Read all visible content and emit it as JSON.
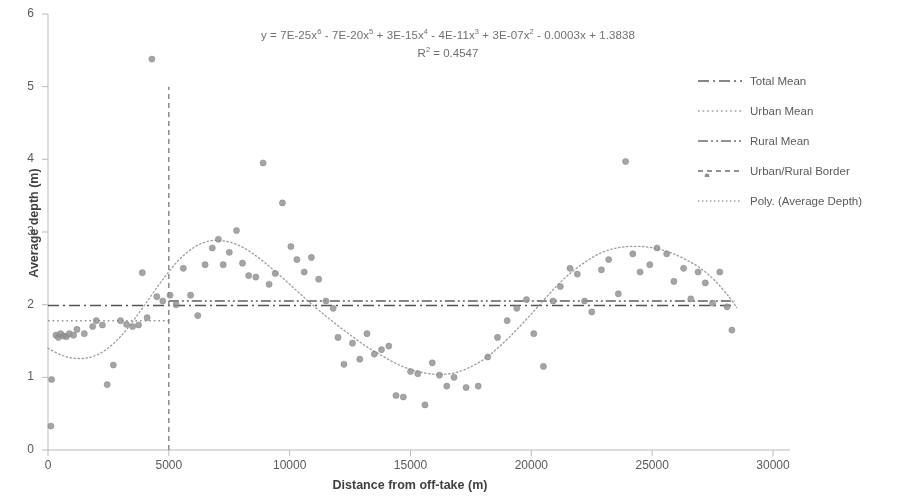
{
  "chart_data": {
    "type": "scatter",
    "title": "",
    "xlabel": "Distance from off-take (m)",
    "ylabel": "Average depth (m)",
    "xlim": [
      0,
      30000
    ],
    "ylim": [
      0,
      6
    ],
    "xticks": [
      "0",
      "5000",
      "10000",
      "15000",
      "20000",
      "25000",
      "30000"
    ],
    "yticks": [
      "0",
      "1",
      "2",
      "3",
      "4",
      "5",
      "6"
    ],
    "grid": false,
    "legend_position": "right",
    "annotations": {
      "equation": "y = 7E-25x⁶ - 7E-20x⁵ + 3E-15x⁴ - 4E-11x³ + 3E-07x² - 0.0003x + 1.3838",
      "equation_parts": {
        "prefix": "y = 7E-25x",
        "e1": "6",
        "t2": " - 7E-20x",
        "e2": "5",
        "t3": " + 3E-15x",
        "e3": "4",
        "t4": " - 4E-11x",
        "e4": "3",
        "t5": " + 3E-07x",
        "e5": "2",
        "t6": " - 0.0003x + 1.3838"
      },
      "r_squared_label": "R",
      "r_squared_sup": "2",
      "r_squared_value": " = 0.4547"
    },
    "series": [
      {
        "name": "Average Depth",
        "type": "scatter",
        "marker_color": "#8a8a8a",
        "points": [
          [
            120,
            0.33
          ],
          [
            150,
            0.97
          ],
          [
            330,
            1.58
          ],
          [
            430,
            1.55
          ],
          [
            520,
            1.6
          ],
          [
            640,
            1.57
          ],
          [
            760,
            1.56
          ],
          [
            880,
            1.6
          ],
          [
            1060,
            1.58
          ],
          [
            1200,
            1.66
          ],
          [
            1500,
            1.6
          ],
          [
            1850,
            1.7
          ],
          [
            2000,
            1.78
          ],
          [
            2250,
            1.72
          ],
          [
            2450,
            0.9
          ],
          [
            2700,
            1.17
          ],
          [
            3000,
            1.78
          ],
          [
            3250,
            1.73
          ],
          [
            3500,
            1.7
          ],
          [
            3750,
            1.72
          ],
          [
            3900,
            2.44
          ],
          [
            4100,
            1.82
          ],
          [
            4300,
            5.38
          ],
          [
            4500,
            2.11
          ],
          [
            4750,
            2.05
          ],
          [
            5050,
            2.13
          ],
          [
            5300,
            2.0
          ],
          [
            5600,
            2.5
          ],
          [
            5900,
            2.13
          ],
          [
            6200,
            1.85
          ],
          [
            6500,
            2.55
          ],
          [
            6800,
            2.78
          ],
          [
            7050,
            2.9
          ],
          [
            7250,
            2.55
          ],
          [
            7500,
            2.72
          ],
          [
            7800,
            3.02
          ],
          [
            8050,
            2.57
          ],
          [
            8300,
            2.4
          ],
          [
            8600,
            2.38
          ],
          [
            8900,
            3.95
          ],
          [
            9150,
            2.28
          ],
          [
            9400,
            2.43
          ],
          [
            9700,
            3.4
          ],
          [
            10050,
            2.8
          ],
          [
            10300,
            2.62
          ],
          [
            10600,
            2.45
          ],
          [
            10900,
            2.65
          ],
          [
            11200,
            2.35
          ],
          [
            11500,
            2.05
          ],
          [
            11800,
            1.95
          ],
          [
            12000,
            1.55
          ],
          [
            12250,
            1.18
          ],
          [
            12600,
            1.47
          ],
          [
            12900,
            1.25
          ],
          [
            13200,
            1.6
          ],
          [
            13500,
            1.32
          ],
          [
            13800,
            1.38
          ],
          [
            14100,
            1.43
          ],
          [
            14400,
            0.75
          ],
          [
            14700,
            0.73
          ],
          [
            15000,
            1.08
          ],
          [
            15300,
            1.05
          ],
          [
            15600,
            0.62
          ],
          [
            15900,
            1.2
          ],
          [
            16200,
            1.03
          ],
          [
            16500,
            0.88
          ],
          [
            16800,
            1.0
          ],
          [
            17300,
            0.86
          ],
          [
            17800,
            0.88
          ],
          [
            18200,
            1.28
          ],
          [
            18600,
            1.55
          ],
          [
            19000,
            1.78
          ],
          [
            19400,
            1.95
          ],
          [
            19800,
            2.07
          ],
          [
            20100,
            1.6
          ],
          [
            20500,
            1.15
          ],
          [
            20900,
            2.05
          ],
          [
            21200,
            2.25
          ],
          [
            21600,
            2.5
          ],
          [
            21900,
            2.42
          ],
          [
            22200,
            2.05
          ],
          [
            22500,
            1.9
          ],
          [
            22900,
            2.48
          ],
          [
            23200,
            2.62
          ],
          [
            23600,
            2.15
          ],
          [
            23900,
            3.97
          ],
          [
            24200,
            2.7
          ],
          [
            24500,
            2.45
          ],
          [
            24900,
            2.55
          ],
          [
            25200,
            2.78
          ],
          [
            25600,
            2.7
          ],
          [
            25900,
            2.32
          ],
          [
            26300,
            2.5
          ],
          [
            26600,
            2.08
          ],
          [
            26900,
            2.45
          ],
          [
            27200,
            2.3
          ],
          [
            27500,
            2.02
          ],
          [
            27800,
            2.45
          ],
          [
            28100,
            1.97
          ],
          [
            28300,
            1.65
          ]
        ]
      }
    ],
    "trendline": {
      "name": "Poly. (Average Depth)",
      "order": 6,
      "color": "#9a9a9a",
      "style": "dotted",
      "points": [
        [
          0,
          1.4
        ],
        [
          600,
          1.3
        ],
        [
          1200,
          1.26
        ],
        [
          1800,
          1.28
        ],
        [
          2400,
          1.38
        ],
        [
          3000,
          1.56
        ],
        [
          3600,
          1.81
        ],
        [
          4200,
          2.09
        ],
        [
          4800,
          2.37
        ],
        [
          5400,
          2.61
        ],
        [
          6000,
          2.78
        ],
        [
          6600,
          2.87
        ],
        [
          7200,
          2.88
        ],
        [
          7800,
          2.83
        ],
        [
          8400,
          2.72
        ],
        [
          9000,
          2.57
        ],
        [
          9600,
          2.4
        ],
        [
          10200,
          2.22
        ],
        [
          10800,
          2.04
        ],
        [
          11400,
          1.87
        ],
        [
          12000,
          1.71
        ],
        [
          12600,
          1.56
        ],
        [
          13200,
          1.42
        ],
        [
          13800,
          1.3
        ],
        [
          14400,
          1.19
        ],
        [
          15000,
          1.11
        ],
        [
          15600,
          1.06
        ],
        [
          16200,
          1.04
        ],
        [
          16800,
          1.06
        ],
        [
          17400,
          1.13
        ],
        [
          18000,
          1.24
        ],
        [
          18600,
          1.4
        ],
        [
          19200,
          1.59
        ],
        [
          19800,
          1.8
        ],
        [
          20400,
          2.02
        ],
        [
          21000,
          2.24
        ],
        [
          21600,
          2.43
        ],
        [
          22200,
          2.58
        ],
        [
          22800,
          2.7
        ],
        [
          23400,
          2.77
        ],
        [
          24000,
          2.8
        ],
        [
          24600,
          2.8
        ],
        [
          25200,
          2.77
        ],
        [
          25800,
          2.71
        ],
        [
          26400,
          2.62
        ],
        [
          27000,
          2.5
        ],
        [
          27600,
          2.33
        ],
        [
          28200,
          2.1
        ],
        [
          28500,
          1.96
        ]
      ]
    },
    "reference_lines": [
      {
        "name": "Total Mean",
        "orientation": "horizontal",
        "value": 1.99,
        "style": "dashdot",
        "color": "#4f4f4f",
        "x_start": 0,
        "x_end": 28400
      },
      {
        "name": "Urban Mean",
        "orientation": "horizontal",
        "value": 1.78,
        "style": "dotted",
        "color": "#8f8f8f",
        "x_start": 0,
        "x_end": 5000
      },
      {
        "name": "Rural Mean",
        "orientation": "horizontal",
        "value": 2.05,
        "style": "dashdotdot",
        "color": "#5a5a5a",
        "x_start": 5000,
        "x_end": 28400
      },
      {
        "name": "Urban/Rural Border",
        "orientation": "vertical",
        "value": 5000,
        "style": "dashed",
        "color": "#6a6a6a",
        "y_start": 0,
        "y_end": 5.0
      }
    ],
    "legend": [
      {
        "label": "Total Mean",
        "style": "dashdot",
        "color": "#5a5a5a",
        "marker": false
      },
      {
        "label": "Urban Mean",
        "style": "dotted",
        "color": "#9a9a9a",
        "marker": false
      },
      {
        "label": "Rural Mean",
        "style": "dashdotdot",
        "color": "#6a6a6a",
        "marker": false
      },
      {
        "label": "Urban/Rural Border",
        "style": "dashed",
        "color": "#6a6a6a",
        "marker": true
      },
      {
        "label": "Poly. (Average Depth)",
        "style": "finedot",
        "color": "#9a9a9a",
        "marker": false
      }
    ]
  },
  "axes": {
    "y_title": "Average depth (m)",
    "x_title": "Distance from off-take (m)"
  }
}
